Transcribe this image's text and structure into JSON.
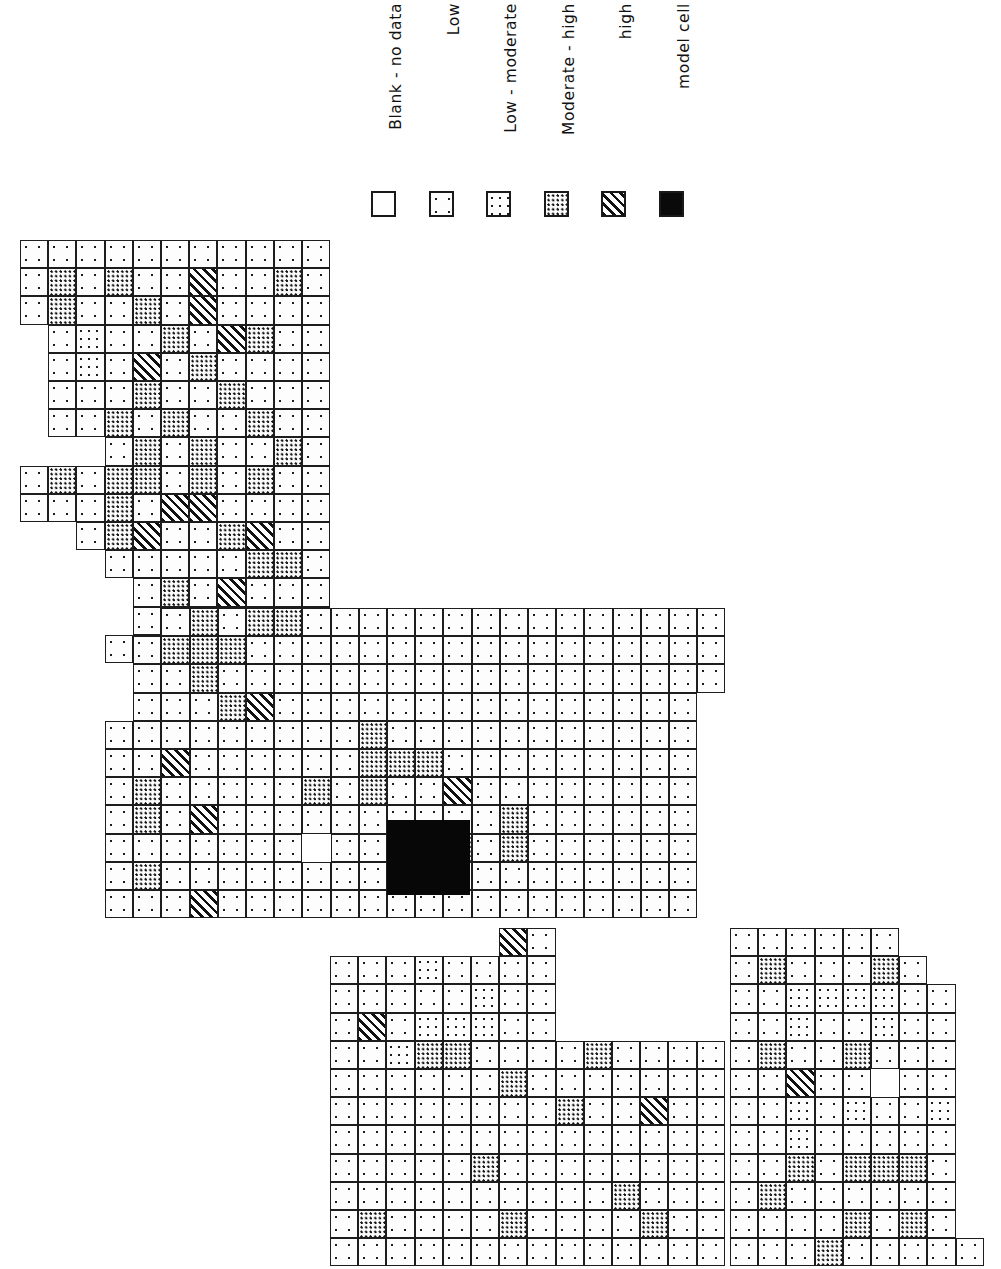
{
  "figure": {
    "orientation": "rotated-90-ccw"
  },
  "legend": {
    "title": "",
    "items": [
      {
        "label": "Blank - no data",
        "pattern": "blank",
        "swatch_name": "swatch-blank"
      },
      {
        "label": "Low",
        "pattern": "low",
        "swatch_name": "swatch-low"
      },
      {
        "label": "Low - moderate",
        "pattern": "lowmod",
        "swatch_name": "swatch-low-moderate"
      },
      {
        "label": "Moderate - high",
        "pattern": "modhigh",
        "swatch_name": "swatch-moderate-high"
      },
      {
        "label": "high",
        "pattern": "high",
        "swatch_name": "swatch-high"
      },
      {
        "label": "model cell",
        "pattern": "model",
        "swatch_name": "swatch-model-cell"
      }
    ],
    "colors": {
      "ink": "#1a1a1a",
      "paper": "#ffffff",
      "model_cell": "#0a0a0a"
    }
  },
  "chart_data": {
    "type": "heatmap",
    "title": "",
    "xlabel": "",
    "ylabel": "",
    "grid": true,
    "legend_position": "top",
    "cell_size_px": 28.2,
    "categories_legend": [
      "blank",
      "low",
      "lowmod",
      "modhigh",
      "high",
      "model"
    ],
    "model_cell": {
      "block": "middle",
      "col": 15,
      "row": 8,
      "col_span": 3,
      "row_span": 3
    },
    "blocks": [
      {
        "name": "upper-left-block",
        "origin": {
          "x": 20,
          "y": 240
        },
        "cols": 11,
        "rows": 15,
        "rows_data": [
          [
            "low",
            "low",
            "low",
            "low",
            "low",
            "low",
            "low",
            "low",
            "low",
            "low",
            "low"
          ],
          [
            "low",
            "modhigh",
            "low",
            "modhigh",
            "low",
            "low",
            "high",
            "low",
            "low",
            "modhigh",
            "low"
          ],
          [
            "low",
            "modhigh",
            "low",
            "low",
            "modhigh",
            "low",
            "high",
            "low",
            "low",
            "low",
            "low"
          ],
          [
            "blank",
            "low",
            "lowmod",
            "low",
            "low",
            "modhigh",
            "low",
            "high",
            "modhigh",
            "low",
            "low"
          ],
          [
            "blank",
            "low",
            "lowmod",
            "low",
            "high",
            "low",
            "modhigh",
            "low",
            "low",
            "low",
            "low"
          ],
          [
            "blank",
            "low",
            "low",
            "low",
            "modhigh",
            "low",
            "low",
            "modhigh",
            "low",
            "low",
            "low"
          ],
          [
            "blank",
            "low",
            "low",
            "modhigh",
            "low",
            "modhigh",
            "low",
            "low",
            "modhigh",
            "low",
            "low"
          ],
          [
            "blank",
            "blank",
            "blank",
            "low",
            "modhigh",
            "low",
            "modhigh",
            "low",
            "low",
            "modhigh",
            "low"
          ],
          [
            "low",
            "modhigh",
            "low",
            "modhigh",
            "modhigh",
            "low",
            "modhigh",
            "low",
            "modhigh",
            "low",
            "low"
          ],
          [
            "low",
            "low",
            "low",
            "modhigh",
            "low",
            "high",
            "high",
            "low",
            "low",
            "low",
            "low"
          ],
          [
            "blank",
            "blank",
            "low",
            "modhigh",
            "high",
            "low",
            "low",
            "modhigh",
            "high",
            "low",
            "low"
          ],
          [
            "blank",
            "blank",
            "blank",
            "low",
            "low",
            "low",
            "low",
            "low",
            "modhigh",
            "modhigh",
            "low"
          ],
          [
            "blank",
            "blank",
            "blank",
            "blank",
            "low",
            "modhigh",
            "low",
            "high",
            "low",
            "low",
            "low"
          ],
          [
            "blank",
            "blank",
            "blank",
            "blank",
            "low",
            "modhigh",
            "low",
            "modhigh",
            "low",
            "low",
            "low"
          ],
          [
            "blank",
            "blank",
            "blank",
            "low",
            "modhigh",
            "low",
            "modhigh",
            "low",
            "low",
            "low",
            "low"
          ]
        ]
      },
      {
        "name": "middle-block",
        "origin": {
          "x": 105,
          "y": 608
        },
        "cols": 22,
        "rows": 11,
        "rows_data": [
          [
            "blank",
            "blank",
            "low",
            "modhigh",
            "low",
            "modhigh",
            "modhigh",
            "low",
            "low",
            "low",
            "low",
            "low",
            "low",
            "low",
            "low",
            "low",
            "low",
            "low",
            "low",
            "low",
            "low",
            "low"
          ],
          [
            "blank",
            "low",
            "modhigh",
            "modhigh",
            "modhigh",
            "low",
            "low",
            "low",
            "low",
            "low",
            "low",
            "low",
            "low",
            "low",
            "low",
            "low",
            "low",
            "low",
            "low",
            "low",
            "low",
            "low"
          ],
          [
            "blank",
            "low",
            "low",
            "modhigh",
            "low",
            "low",
            "low",
            "low",
            "low",
            "low",
            "low",
            "low",
            "low",
            "low",
            "low",
            "low",
            "low",
            "low",
            "low",
            "low",
            "low",
            "low"
          ],
          [
            "blank",
            "low",
            "low",
            "low",
            "modhigh",
            "high",
            "low",
            "low",
            "low",
            "low",
            "low",
            "low",
            "low",
            "low",
            "low",
            "low",
            "low",
            "low",
            "low",
            "low",
            "low",
            "blank"
          ],
          [
            "low",
            "low",
            "low",
            "low",
            "low",
            "low",
            "low",
            "low",
            "low",
            "modhigh",
            "low",
            "low",
            "low",
            "low",
            "low",
            "low",
            "low",
            "low",
            "low",
            "low",
            "low",
            "blank"
          ],
          [
            "low",
            "low",
            "high",
            "low",
            "low",
            "low",
            "low",
            "low",
            "low",
            "modhigh",
            "modhigh",
            "modhigh",
            "low",
            "low",
            "low",
            "low",
            "low",
            "low",
            "low",
            "low",
            "low",
            "blank"
          ],
          [
            "low",
            "modhigh",
            "low",
            "low",
            "low",
            "low",
            "low",
            "modhigh",
            "low",
            "modhigh",
            "low",
            "low",
            "high",
            "low",
            "low",
            "low",
            "low",
            "low",
            "low",
            "low",
            "low",
            "blank"
          ],
          [
            "low",
            "modhigh",
            "low",
            "high",
            "low",
            "low",
            "low",
            "low",
            "low",
            "low",
            "low",
            "low",
            "low",
            "low",
            "modhigh",
            "low",
            "low",
            "low",
            "low",
            "low",
            "low",
            "blank"
          ],
          [
            "low",
            "low",
            "low",
            "low",
            "low",
            "low",
            "low",
            "blank",
            "low",
            "low",
            "model",
            "model",
            "modhigh",
            "low",
            "modhigh",
            "low",
            "low",
            "low",
            "low",
            "low",
            "low",
            "blank"
          ],
          [
            "low",
            "modhigh",
            "low",
            "low",
            "low",
            "low",
            "low",
            "low",
            "low",
            "low",
            "model",
            "model",
            "low",
            "low",
            "low",
            "low",
            "low",
            "low",
            "low",
            "low",
            "low",
            "blank"
          ],
          [
            "low",
            "low",
            "low",
            "high",
            "low",
            "low",
            "low",
            "low",
            "low",
            "low",
            "low",
            "low",
            "low",
            "low",
            "low",
            "low",
            "low",
            "low",
            "low",
            "low",
            "low",
            "blank"
          ]
        ]
      },
      {
        "name": "lower-right-block",
        "origin": {
          "x": 730,
          "y": 928
        },
        "cols": 9,
        "rows": 12,
        "rows_data": [
          [
            "low",
            "low",
            "low",
            "low",
            "low",
            "low",
            "blank",
            "blank",
            "blank"
          ],
          [
            "low",
            "modhigh",
            "low",
            "low",
            "low",
            "modhigh",
            "low",
            "blank",
            "blank"
          ],
          [
            "low",
            "low",
            "lowmod",
            "lowmod",
            "lowmod",
            "lowmod",
            "low",
            "low",
            "blank"
          ],
          [
            "low",
            "low",
            "lowmod",
            "low",
            "low",
            "lowmod",
            "low",
            "low",
            "blank"
          ],
          [
            "low",
            "modhigh",
            "low",
            "low",
            "modhigh",
            "low",
            "low",
            "low",
            "blank"
          ],
          [
            "low",
            "low",
            "high",
            "low",
            "low",
            "blank",
            "low",
            "low",
            "blank"
          ],
          [
            "low",
            "low",
            "lowmod",
            "low",
            "lowmod",
            "low",
            "low",
            "lowmod",
            "blank"
          ],
          [
            "low",
            "low",
            "lowmod",
            "low",
            "low",
            "low",
            "low",
            "low",
            "blank"
          ],
          [
            "low",
            "low",
            "modhigh",
            "low",
            "modhigh",
            "modhigh",
            "modhigh",
            "low",
            "blank"
          ],
          [
            "low",
            "modhigh",
            "low",
            "low",
            "low",
            "low",
            "low",
            "low",
            "blank"
          ],
          [
            "low",
            "low",
            "low",
            "low",
            "modhigh",
            "low",
            "modhigh",
            "low",
            "blank"
          ],
          [
            "low",
            "low",
            "low",
            "modhigh",
            "low",
            "low",
            "low",
            "low",
            "low"
          ]
        ]
      },
      {
        "name": "lower-middle-extension",
        "origin": {
          "x": 330,
          "y": 928
        },
        "cols": 14,
        "rows": 12,
        "rows_data": [
          [
            "blank",
            "blank",
            "blank",
            "blank",
            "blank",
            "blank",
            "high",
            "low",
            "blank",
            "blank",
            "blank",
            "blank",
            "blank",
            "blank"
          ],
          [
            "low",
            "low",
            "low",
            "lowmod",
            "low",
            "low",
            "low",
            "low",
            "blank",
            "blank",
            "blank",
            "blank",
            "blank",
            "blank"
          ],
          [
            "low",
            "low",
            "low",
            "low",
            "low",
            "lowmod",
            "low",
            "low",
            "blank",
            "blank",
            "blank",
            "blank",
            "blank",
            "blank"
          ],
          [
            "low",
            "high",
            "low",
            "lowmod",
            "lowmod",
            "lowmod",
            "low",
            "low",
            "blank",
            "blank",
            "blank",
            "blank",
            "blank",
            "blank"
          ],
          [
            "low",
            "low",
            "lowmod",
            "modhigh",
            "modhigh",
            "low",
            "low",
            "low",
            "low",
            "modhigh",
            "low",
            "low",
            "low",
            "low"
          ],
          [
            "low",
            "low",
            "low",
            "low",
            "low",
            "low",
            "modhigh",
            "low",
            "low",
            "low",
            "low",
            "low",
            "low",
            "low"
          ],
          [
            "low",
            "low",
            "low",
            "low",
            "low",
            "low",
            "low",
            "low",
            "modhigh",
            "low",
            "low",
            "high",
            "low",
            "low"
          ],
          [
            "low",
            "low",
            "low",
            "low",
            "low",
            "low",
            "low",
            "low",
            "low",
            "low",
            "low",
            "low",
            "low",
            "low"
          ],
          [
            "low",
            "low",
            "low",
            "low",
            "low",
            "modhigh",
            "low",
            "low",
            "low",
            "low",
            "low",
            "low",
            "low",
            "low"
          ],
          [
            "low",
            "low",
            "low",
            "low",
            "low",
            "low",
            "low",
            "low",
            "low",
            "low",
            "modhigh",
            "low",
            "low",
            "low"
          ],
          [
            "low",
            "modhigh",
            "low",
            "low",
            "low",
            "low",
            "modhigh",
            "low",
            "low",
            "low",
            "low",
            "modhigh",
            "low",
            "low"
          ],
          [
            "low",
            "low",
            "low",
            "low",
            "low",
            "low",
            "low",
            "low",
            "low",
            "low",
            "low",
            "low",
            "low",
            "low"
          ]
        ]
      }
    ]
  }
}
